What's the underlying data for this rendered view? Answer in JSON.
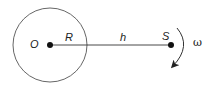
{
  "diagram": {
    "type": "physics-orbit-diagram",
    "labels": {
      "center": "O",
      "radius": "R",
      "distance": "h",
      "satellite": "S",
      "angular_velocity": "ω"
    },
    "colors": {
      "stroke": "#222222",
      "background": "#ffffff"
    },
    "geometry": {
      "circle_center": [
        50,
        45
      ],
      "circle_radius": 37,
      "satellite_position": [
        171,
        45
      ]
    }
  }
}
